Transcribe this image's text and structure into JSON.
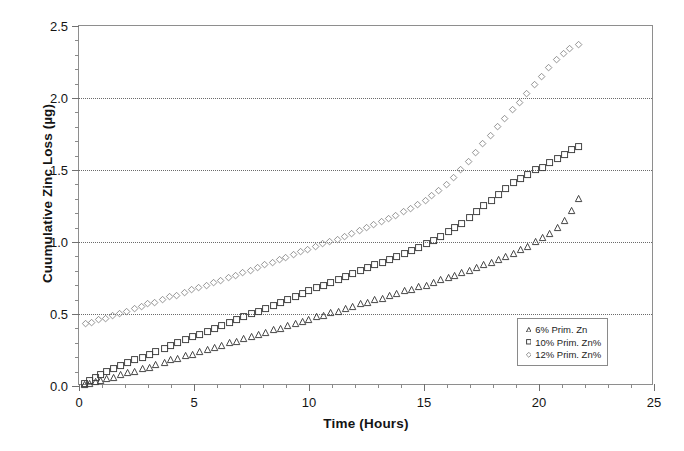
{
  "chart_data": {
    "type": "scatter",
    "title": "",
    "xlabel": "Time (Hours)",
    "ylabel": "Cuumulative Zinc Loss (µg)",
    "xlim": [
      0,
      25
    ],
    "ylim": [
      0.0,
      2.5
    ],
    "xticks": [
      0,
      5,
      10,
      15,
      20,
      25
    ],
    "xtick_labels": [
      "0",
      "5",
      "10",
      "15",
      "20",
      "25"
    ],
    "xtick_minor_step": 1,
    "yticks": [
      0.0,
      0.5,
      1.0,
      1.5,
      2.0,
      2.5
    ],
    "ytick_labels": [
      "0.0",
      "0.5",
      "1.0",
      "1.5",
      "2.0",
      "2.5"
    ],
    "ytick_minor_step": 0.1,
    "grid": "horizontal-dotted-at-major-y",
    "gridlines_y": [
      0.5,
      1.0,
      1.5,
      2.0
    ],
    "legend_position": "lower-right-inside",
    "marker_style": "open",
    "series": [
      {
        "name": "6% Prim. Zn",
        "marker": "triangle",
        "color": "#3c3c3c",
        "x": [
          0.25,
          0.45,
          0.7,
          0.95,
          1.2,
          1.5,
          1.8,
          2.1,
          2.4,
          2.75,
          3.05,
          3.35,
          3.7,
          4.0,
          4.3,
          4.65,
          4.95,
          5.25,
          5.6,
          5.9,
          6.2,
          6.55,
          6.85,
          7.15,
          7.5,
          7.8,
          8.1,
          8.45,
          8.75,
          9.05,
          9.4,
          9.7,
          10.0,
          10.35,
          10.65,
          10.95,
          11.3,
          11.6,
          11.9,
          12.25,
          12.55,
          12.85,
          13.2,
          13.5,
          13.8,
          14.15,
          14.45,
          14.75,
          15.1,
          15.4,
          15.7,
          16.05,
          16.35,
          16.65,
          17.0,
          17.3,
          17.6,
          17.95,
          18.25,
          18.55,
          18.9,
          19.2,
          19.5,
          19.85,
          20.15,
          20.45,
          20.8,
          21.1,
          21.4,
          21.7
        ],
        "y": [
          0.01,
          0.02,
          0.03,
          0.04,
          0.05,
          0.06,
          0.08,
          0.09,
          0.1,
          0.12,
          0.13,
          0.15,
          0.16,
          0.18,
          0.19,
          0.21,
          0.22,
          0.24,
          0.25,
          0.27,
          0.28,
          0.3,
          0.31,
          0.33,
          0.34,
          0.36,
          0.37,
          0.39,
          0.4,
          0.42,
          0.43,
          0.45,
          0.46,
          0.48,
          0.49,
          0.51,
          0.52,
          0.54,
          0.55,
          0.57,
          0.58,
          0.6,
          0.61,
          0.63,
          0.64,
          0.66,
          0.67,
          0.69,
          0.7,
          0.72,
          0.74,
          0.75,
          0.77,
          0.79,
          0.8,
          0.82,
          0.84,
          0.86,
          0.88,
          0.9,
          0.92,
          0.95,
          0.97,
          1.0,
          1.03,
          1.06,
          1.1,
          1.15,
          1.22,
          1.3
        ]
      },
      {
        "name": "10% Prim. Zn%",
        "marker": "square",
        "color": "#3c3c3c",
        "x": [
          0.25,
          0.45,
          0.7,
          0.95,
          1.2,
          1.5,
          1.8,
          2.1,
          2.4,
          2.75,
          3.05,
          3.35,
          3.7,
          4.0,
          4.3,
          4.65,
          4.95,
          5.25,
          5.6,
          5.9,
          6.2,
          6.55,
          6.85,
          7.15,
          7.5,
          7.8,
          8.1,
          8.45,
          8.75,
          9.05,
          9.4,
          9.7,
          10.0,
          10.35,
          10.65,
          10.95,
          11.3,
          11.6,
          11.9,
          12.25,
          12.55,
          12.85,
          13.2,
          13.5,
          13.8,
          14.15,
          14.45,
          14.75,
          15.1,
          15.4,
          15.7,
          16.05,
          16.35,
          16.65,
          17.0,
          17.3,
          17.6,
          17.95,
          18.25,
          18.55,
          18.9,
          19.2,
          19.5,
          19.85,
          20.15,
          20.45,
          20.8,
          21.1,
          21.4,
          21.7
        ],
        "y": [
          0.02,
          0.04,
          0.06,
          0.08,
          0.1,
          0.12,
          0.14,
          0.16,
          0.18,
          0.2,
          0.22,
          0.24,
          0.26,
          0.28,
          0.3,
          0.32,
          0.34,
          0.36,
          0.38,
          0.4,
          0.42,
          0.44,
          0.46,
          0.48,
          0.5,
          0.52,
          0.54,
          0.56,
          0.58,
          0.6,
          0.62,
          0.64,
          0.66,
          0.68,
          0.7,
          0.72,
          0.74,
          0.76,
          0.78,
          0.8,
          0.82,
          0.84,
          0.86,
          0.88,
          0.9,
          0.92,
          0.94,
          0.96,
          0.99,
          1.01,
          1.04,
          1.07,
          1.1,
          1.13,
          1.17,
          1.21,
          1.25,
          1.29,
          1.33,
          1.37,
          1.41,
          1.44,
          1.47,
          1.5,
          1.52,
          1.55,
          1.58,
          1.61,
          1.64,
          1.66
        ]
      },
      {
        "name": "12% Prim. Zn%",
        "marker": "diamond",
        "color": "#8c8c8c",
        "x": [
          0.3,
          0.55,
          0.85,
          1.15,
          1.45,
          1.75,
          2.05,
          2.4,
          2.7,
          3.0,
          3.3,
          3.65,
          3.95,
          4.25,
          4.6,
          4.9,
          5.2,
          5.55,
          5.85,
          6.15,
          6.5,
          6.8,
          7.1,
          7.45,
          7.75,
          8.05,
          8.4,
          8.7,
          9.0,
          9.35,
          9.65,
          9.95,
          10.3,
          10.6,
          10.9,
          11.25,
          11.55,
          11.85,
          12.2,
          12.5,
          12.8,
          13.15,
          13.45,
          13.75,
          14.1,
          14.4,
          14.7,
          15.05,
          15.35,
          15.65,
          16.0,
          16.3,
          16.6,
          16.95,
          17.25,
          17.55,
          17.9,
          18.2,
          18.5,
          18.85,
          19.15,
          19.45,
          19.8,
          20.1,
          20.4,
          20.75,
          21.05,
          21.35,
          21.7
        ],
        "y": [
          0.43,
          0.44,
          0.46,
          0.47,
          0.49,
          0.5,
          0.52,
          0.54,
          0.55,
          0.57,
          0.58,
          0.6,
          0.62,
          0.63,
          0.65,
          0.67,
          0.68,
          0.7,
          0.72,
          0.73,
          0.75,
          0.77,
          0.79,
          0.8,
          0.82,
          0.84,
          0.86,
          0.88,
          0.89,
          0.91,
          0.93,
          0.95,
          0.97,
          0.99,
          1.0,
          1.02,
          1.04,
          1.06,
          1.08,
          1.1,
          1.12,
          1.14,
          1.16,
          1.18,
          1.21,
          1.23,
          1.26,
          1.29,
          1.32,
          1.36,
          1.4,
          1.45,
          1.5,
          1.56,
          1.62,
          1.68,
          1.74,
          1.8,
          1.86,
          1.92,
          1.97,
          2.03,
          2.09,
          2.15,
          2.21,
          2.27,
          2.31,
          2.34,
          2.37
        ]
      }
    ]
  }
}
